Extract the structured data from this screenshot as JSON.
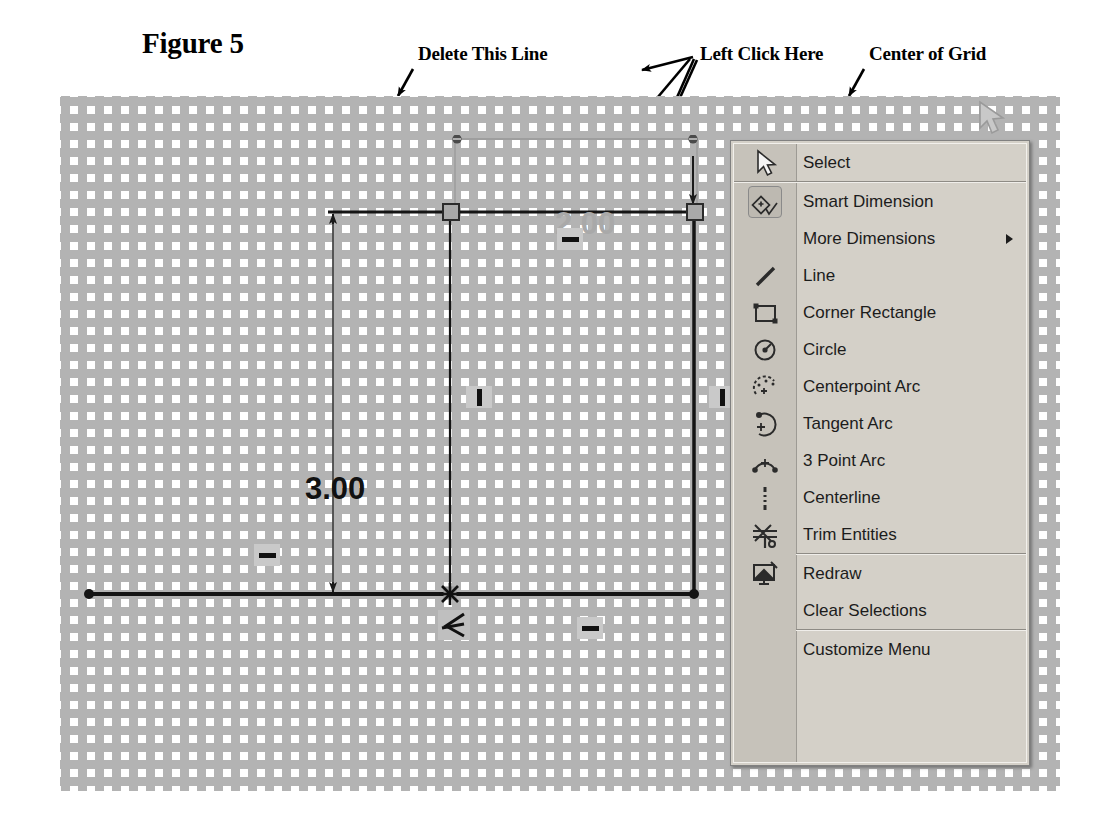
{
  "figure": {
    "title": "Figure 5"
  },
  "annotations": [
    {
      "id": "delete-this-line",
      "text": "Delete This Line"
    },
    {
      "id": "left-click-here",
      "text": "Left Click Here"
    },
    {
      "id": "center-of-grid",
      "text": "Center of Grid"
    }
  ],
  "sketch": {
    "dimensions": [
      {
        "name": "horizontal-dimension",
        "value": "2.00",
        "color": "#a9a9a9",
        "orientation": "horizontal"
      },
      {
        "name": "vertical-dimension",
        "value": "3.00",
        "color": "#111111",
        "orientation": "vertical"
      }
    ],
    "constraints": [
      {
        "name": "horizontal-constraint-top",
        "glyph": "horizontal-bar"
      },
      {
        "name": "vertical-constraint-left",
        "glyph": "vertical-bar"
      },
      {
        "name": "vertical-constraint-right",
        "glyph": "vertical-bar"
      },
      {
        "name": "horizontal-constraint-bottom-left",
        "glyph": "horizontal-bar"
      },
      {
        "name": "horizontal-constraint-bottom-right",
        "glyph": "horizontal-bar"
      }
    ],
    "colors": {
      "grid": "#9a9a9a",
      "geometry": "#141414",
      "dimension_gray": "#a9a9a9",
      "endpoint_handle": "#9b9b9b"
    }
  },
  "context_menu": {
    "background": "#d4d0c8",
    "items": [
      {
        "label": "Select",
        "icon": "cursor-arrow-icon",
        "selected": false,
        "submenu": false
      },
      {
        "label": "Smart Dimension",
        "icon": "smart-dimension-icon",
        "selected": true,
        "submenu": false
      },
      {
        "label": "More Dimensions",
        "icon": "none",
        "selected": false,
        "submenu": true
      },
      {
        "label": "Line",
        "icon": "line-icon",
        "selected": false,
        "submenu": false
      },
      {
        "label": "Corner Rectangle",
        "icon": "rectangle-icon",
        "selected": false,
        "submenu": false
      },
      {
        "label": "Circle",
        "icon": "circle-icon",
        "selected": false,
        "submenu": false
      },
      {
        "label": "Centerpoint Arc",
        "icon": "centerpoint-arc-icon",
        "selected": false,
        "submenu": false
      },
      {
        "label": "Tangent Arc",
        "icon": "tangent-arc-icon",
        "selected": false,
        "submenu": false
      },
      {
        "label": "3 Point Arc",
        "icon": "three-point-arc-icon",
        "selected": false,
        "submenu": false
      },
      {
        "label": "Centerline",
        "icon": "centerline-icon",
        "selected": false,
        "submenu": false
      },
      {
        "label": "Trim Entities",
        "icon": "trim-entities-icon",
        "selected": false,
        "submenu": false
      },
      {
        "label": "Redraw",
        "icon": "redraw-icon",
        "selected": false,
        "submenu": false
      },
      {
        "label": "Clear Selections",
        "icon": "none",
        "selected": false,
        "submenu": false
      },
      {
        "label": "Customize Menu",
        "icon": "none",
        "selected": false,
        "submenu": false
      }
    ]
  }
}
